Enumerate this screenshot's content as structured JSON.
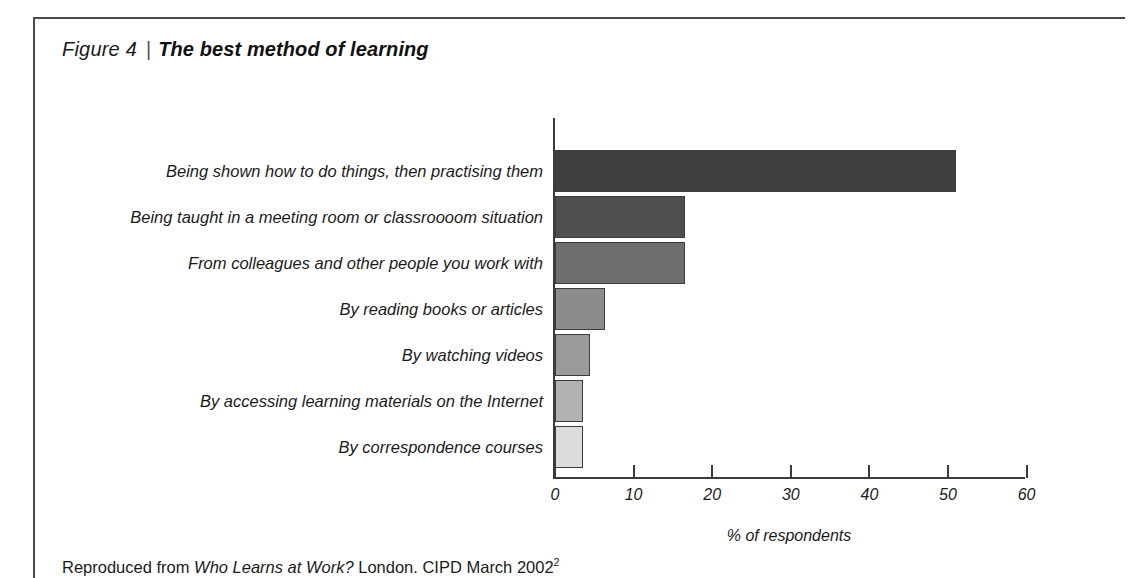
{
  "figure": {
    "number_label": "Figure 4",
    "separator": "|",
    "title": "The best method of learning"
  },
  "caption": {
    "prefix": "Reproduced from ",
    "source_title": "Who Learns at Work?",
    "suffix": " London. CIPD March 2002",
    "footnote_marker": "2"
  },
  "colors": {
    "bar_1": "#3f3f3f",
    "bar_2": "#4f4f4f",
    "bar_3": "#6e6e6e",
    "bar_4": "#8c8c8c",
    "bar_5": "#9a9a9a",
    "bar_6": "#b2b2b2",
    "bar_7": "#dcdcdc",
    "axis": "#3b3b3b",
    "rule": "#4a4a4a",
    "text": "#1b1b1b"
  },
  "chart_data": {
    "type": "bar",
    "orientation": "horizontal",
    "title": "The best method of learning",
    "xlabel": "% of respondents",
    "ylabel": "",
    "xlim": [
      0,
      60
    ],
    "xticks": [
      0,
      10,
      20,
      30,
      40,
      50,
      60
    ],
    "xtick_labels": [
      "0",
      "10",
      "20",
      "30",
      "40",
      "50",
      "60"
    ],
    "grid": false,
    "legend": false,
    "categories": [
      "Being shown how to do things, then practising them",
      "Being taught in a meeting room or classroooom situation",
      "From colleagues and other people you work with",
      "By reading books or articles",
      "By watching videos",
      "By accessing learning materials on the Internet",
      "By correspondence courses"
    ],
    "values": [
      51,
      16.5,
      16.5,
      6.4,
      4.5,
      3.6,
      3.6
    ]
  }
}
